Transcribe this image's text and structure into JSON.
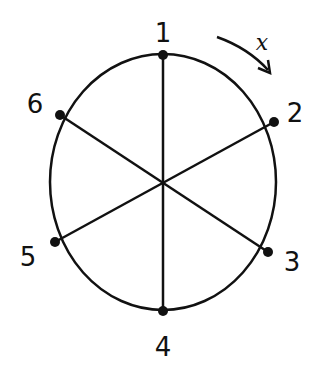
{
  "diagram": {
    "center": {
      "x": 163,
      "y": 182
    },
    "radius": {
      "rx": 113,
      "ry": 128
    },
    "points": [
      {
        "label": "1",
        "x": 163,
        "y": 55,
        "lx": 163,
        "ly": 40
      },
      {
        "label": "2",
        "x": 274,
        "y": 122,
        "lx": 295,
        "ly": 120
      },
      {
        "label": "3",
        "x": 268,
        "y": 252,
        "lx": 292,
        "ly": 270
      },
      {
        "label": "4",
        "x": 163,
        "y": 311,
        "lx": 163,
        "ly": 355
      },
      {
        "label": "5",
        "x": 55,
        "y": 242,
        "lx": 28,
        "ly": 265
      },
      {
        "label": "6",
        "x": 60,
        "y": 115,
        "lx": 35,
        "ly": 112
      }
    ],
    "rotation_label": "x",
    "colors": {
      "stroke": "#111111",
      "background": "#ffffff"
    }
  }
}
